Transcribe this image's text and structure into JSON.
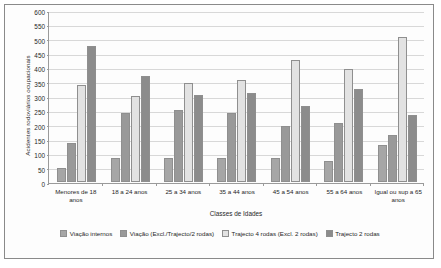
{
  "chart_data": {
    "type": "bar",
    "title": "",
    "xlabel": "Classes de Idades",
    "ylabel": "Acidentes rodoviários ocupacionais",
    "ylim": [
      0,
      600
    ],
    "ytick_step": 50,
    "yticks": [
      0,
      50,
      100,
      150,
      200,
      250,
      300,
      350,
      400,
      450,
      500,
      550,
      600
    ],
    "grid": true,
    "legend_position": "bottom",
    "categories": [
      "Menores de 18 anos",
      "18 a 24 anos",
      "25 a 34 anos",
      "35 a 44 anos",
      "45 a 54 anos",
      "55 a 64 anos",
      "Igual ou sup a 65 anos"
    ],
    "series": [
      {
        "name": "Viação internos",
        "color": "#a6a6a6",
        "values": [
          50,
          85,
          85,
          85,
          85,
          75,
          130
        ]
      },
      {
        "name": "Viação (Excl./Trajecto/2 rodas)",
        "color": "#999999",
        "values": [
          135,
          240,
          250,
          240,
          195,
          205,
          165
        ]
      },
      {
        "name": "Trajecto 4 rodas (Excl. 2 rodas)",
        "color": "#e2e2e2",
        "values": [
          340,
          300,
          345,
          355,
          425,
          395,
          505
        ]
      },
      {
        "name": "Trajecto 2 rodas",
        "color": "#8c8c8c",
        "values": [
          475,
          370,
          305,
          310,
          265,
          325,
          235
        ]
      }
    ]
  },
  "axes": {
    "y_title": "Acidentes rodoviários ocupacionais",
    "x_title": "Classes de Idades"
  }
}
